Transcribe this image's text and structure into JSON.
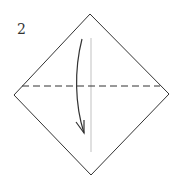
{
  "diagram": {
    "step_number": "2",
    "colors": {
      "outline": "#333333",
      "center_line": "#cccccc",
      "arrow": "#333333"
    }
  }
}
